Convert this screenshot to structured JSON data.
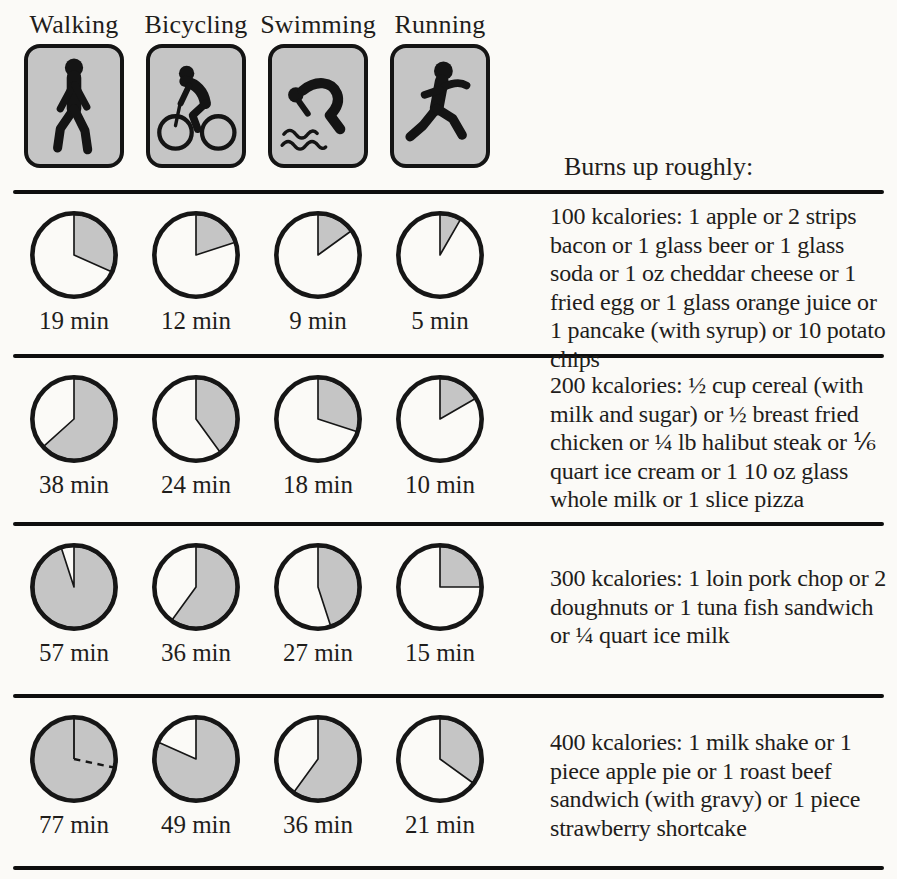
{
  "header": {
    "activities": [
      "Walking",
      "Bicycling",
      "Swimming",
      "Running"
    ],
    "burns_label": "Burns up roughly:"
  },
  "icons": [
    "walking-icon",
    "bicycling-icon",
    "swimming-icon",
    "running-icon"
  ],
  "colors": {
    "pie_fill": "#c5c5c5",
    "icon_fill": "#c5c5c5",
    "ink": "#161616",
    "background": "#fbfaf7"
  },
  "rows": [
    {
      "kcalories_label": "100 kcalories",
      "description": "100 kcalories: 1 apple or 2 strips bacon or 1 glass beer or 1 glass soda or 1 oz cheddar cheese or 1 fried egg or 1 glass orange juice or 1 pancake (with syrup) or 10 potato chips",
      "pies": [
        {
          "minutes": 19,
          "label": "19 min"
        },
        {
          "minutes": 12,
          "label": "12 min"
        },
        {
          "minutes": 9,
          "label": "9 min"
        },
        {
          "minutes": 5,
          "label": "5 min"
        }
      ]
    },
    {
      "kcalories_label": "200 kcalories",
      "description": "200 kcalories: ½ cup cereal (with milk and sugar) or ½ breast fried chicken or ¼ lb halibut steak or ⅙ quart ice cream or 1 10 oz glass whole milk or 1 slice pizza",
      "pies": [
        {
          "minutes": 38,
          "label": "38 min"
        },
        {
          "minutes": 24,
          "label": "24 min"
        },
        {
          "minutes": 18,
          "label": "18 min"
        },
        {
          "minutes": 10,
          "label": "10 min"
        }
      ]
    },
    {
      "kcalories_label": "300 kcalories",
      "description": "300 kcalories: 1 loin pork chop or 2 doughnuts or 1 tuna fish sandwich or ¼ quart ice milk",
      "pies": [
        {
          "minutes": 57,
          "label": "57 min"
        },
        {
          "minutes": 36,
          "label": "36 min"
        },
        {
          "minutes": 27,
          "label": "27 min"
        },
        {
          "minutes": 15,
          "label": "15 min"
        }
      ]
    },
    {
      "kcalories_label": "400 kcalories",
      "description": "400 kcalories: 1 milk shake or 1 piece apple pie or 1 roast beef sandwich (with gravy) or 1 piece strawberry shortcake",
      "pies": [
        {
          "minutes": 77,
          "label": "77 min"
        },
        {
          "minutes": 49,
          "label": "49 min"
        },
        {
          "minutes": 36,
          "label": "36 min"
        },
        {
          "minutes": 21,
          "label": "21 min"
        }
      ]
    }
  ],
  "chart_data": {
    "type": "pie",
    "title": "Burns up roughly:",
    "note": "Each pie is a 60-minute clock face; the shaded wedge (from 12 o'clock, clockwise) is the minutes of that activity needed to burn the row's calories. 77 min is drawn as a full shaded circle plus a dashed overflow radius at 17 min.",
    "categories": [
      "Walking",
      "Bicycling",
      "Swimming",
      "Running"
    ],
    "unit": "min",
    "dial_max_minutes": 60,
    "series": [
      {
        "name": "100 kcalories",
        "values": [
          19,
          12,
          9,
          5
        ]
      },
      {
        "name": "200 kcalories",
        "values": [
          38,
          24,
          18,
          10
        ]
      },
      {
        "name": "300 kcalories",
        "values": [
          57,
          36,
          27,
          15
        ]
      },
      {
        "name": "400 kcalories",
        "values": [
          77,
          49,
          36,
          21
        ]
      }
    ]
  }
}
